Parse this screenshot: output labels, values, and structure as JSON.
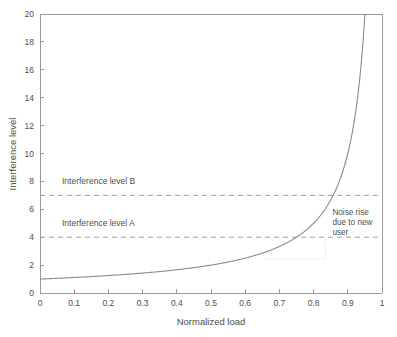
{
  "chart_data": {
    "type": "line",
    "title": "",
    "xlabel": "Normalized load",
    "ylabel": "Interference level",
    "xlim": [
      0,
      1
    ],
    "ylim": [
      0,
      20
    ],
    "grid": false,
    "legend": "none",
    "xticks": [
      "0",
      "0.1",
      "0.2",
      "0.3",
      "0.4",
      "0.5",
      "0.6",
      "0.7",
      "0.8",
      "0.9",
      "1"
    ],
    "xtick_values": [
      0,
      0.1,
      0.2,
      0.3,
      0.4,
      0.5,
      0.6,
      0.7,
      0.8,
      0.9,
      1
    ],
    "yticks": [
      "0",
      "2",
      "4",
      "6",
      "8",
      "10",
      "12",
      "14",
      "16",
      "18",
      "20"
    ],
    "ytick_values": [
      0,
      2,
      4,
      6,
      8,
      10,
      12,
      14,
      16,
      18,
      20
    ],
    "series": [
      {
        "name": "Interference level",
        "formula": "y = 1 / (1 - x)",
        "x": [
          0,
          0.05,
          0.1,
          0.15,
          0.2,
          0.25,
          0.3,
          0.35,
          0.4,
          0.45,
          0.5,
          0.55,
          0.6,
          0.65,
          0.7,
          0.75,
          0.8,
          0.85,
          0.88,
          0.9,
          0.92,
          0.93,
          0.94,
          0.945,
          0.95
        ],
        "values": [
          1,
          1.05,
          1.11,
          1.18,
          1.25,
          1.33,
          1.43,
          1.54,
          1.67,
          1.82,
          2,
          2.22,
          2.5,
          2.86,
          3.33,
          4,
          5,
          6.67,
          8.33,
          10,
          12.5,
          14.29,
          16.67,
          18.18,
          20
        ]
      }
    ],
    "thresholds": [
      {
        "label": "Interference level B",
        "value": 7
      },
      {
        "label": "Interference level A",
        "value": 4
      }
    ],
    "annotations": [
      {
        "name": "noise-rise-note",
        "text_lines": [
          "Noise rise",
          "due to new",
          "user"
        ],
        "x": 0.855,
        "y_top": 5.6
      }
    ],
    "guides": {
      "horizontal": {
        "y": 2.45,
        "x_start": 0.655,
        "x_end": 0.835
      },
      "vertical": {
        "x": 0.835,
        "y_bottom": 2.45,
        "y_top": 4.0
      }
    },
    "colors": {
      "curve": "#8a8a8a",
      "threshold": "#9e9e9e",
      "axis": "#9a9a9a",
      "text": "#4d4d4d",
      "background": "#ffffff",
      "guide": "#cfcfcf"
    }
  }
}
